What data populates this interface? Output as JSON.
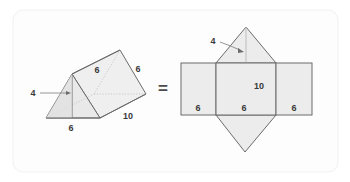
{
  "card": {
    "background": "#ffffff",
    "border_color": "#f2f2f2",
    "inner_background": "#fdfdfd"
  },
  "figure": {
    "title": "",
    "equals_symbol": "=",
    "stroke_color": "#6b6b6b",
    "fill_color": "#ececec",
    "hidden_edge_color": "#c8c8c8",
    "label_color": "#3a3a3a"
  },
  "solid": {
    "name": "triangular-prism",
    "labels": {
      "height": "4",
      "base": "6",
      "slant_left": "6",
      "slant_right": "6",
      "length": "10"
    }
  },
  "net": {
    "name": "triangular-prism-net",
    "labels": {
      "triangle_height": "4",
      "rect_left_width": "6",
      "rect_middle_width": "6",
      "rect_right_width": "6",
      "rect_length": "10"
    }
  }
}
